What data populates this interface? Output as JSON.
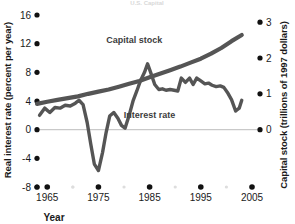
{
  "chart_data": {
    "type": "line",
    "title": "U.S. Capital",
    "xlabel": "Year",
    "ylabel": "Real interest rate (percent per year)",
    "ylabel_right": "Capital stock (trillions of 1997 dollars)",
    "xlim": [
      1963,
      2005
    ],
    "ylim": [
      -8,
      16
    ],
    "ylim_right": [
      -1.6,
      3.2
    ],
    "grid": false,
    "zero_line": true,
    "legend_position": "inline-annotation",
    "x_ticks": [
      1965,
      1975,
      1985,
      1995,
      2005
    ],
    "x_tick_labels": [
      "1965",
      "1975",
      "1985",
      "1995",
      "2005"
    ],
    "y_ticks_left": [
      -8,
      -4,
      0,
      4,
      8,
      12,
      16
    ],
    "y_tick_labels_left": [
      "-8",
      "-4",
      "0",
      "4",
      "8",
      "12",
      "16"
    ],
    "y_ticks_right": [
      0,
      1,
      2,
      3
    ],
    "y_tick_labels_right": [
      "0",
      "1",
      "2",
      "3"
    ],
    "series": [
      {
        "name": "Capital stock",
        "axis": "right",
        "color": "#555555",
        "label_x": 1982,
        "label_y": 2.42,
        "x": [
          1963,
          1965,
          1967,
          1969,
          1971,
          1973,
          1975,
          1977,
          1979,
          1981,
          1983,
          1985,
          1987,
          1989,
          1991,
          1993,
          1995,
          1997,
          1999,
          2001,
          2003
        ],
        "values": [
          0.72,
          0.78,
          0.83,
          0.88,
          0.93,
          1.0,
          1.06,
          1.12,
          1.2,
          1.28,
          1.36,
          1.46,
          1.56,
          1.66,
          1.76,
          1.87,
          1.98,
          2.12,
          2.28,
          2.47,
          2.64
        ]
      },
      {
        "name": "Interest rate",
        "axis": "left",
        "color": "#555555",
        "label_x": 1985,
        "label_y": 1.6,
        "x": [
          1963.5,
          1964.5,
          1965.5,
          1966.5,
          1967.5,
          1968.5,
          1969.5,
          1970.5,
          1971.2,
          1972.0,
          1972.8,
          1973.5,
          1974.2,
          1975.0,
          1975.8,
          1976.5,
          1977.2,
          1978.0,
          1978.8,
          1979.5,
          1980.2,
          1981.0,
          1981.8,
          1982.5,
          1983.2,
          1984.0,
          1984.6,
          1985.2,
          1986.0,
          1986.8,
          1987.5,
          1988.2,
          1989.0,
          1989.8,
          1990.5,
          1991.2,
          1992.0,
          1992.8,
          1993.5,
          1994.2,
          1995.0,
          1995.8,
          1996.5,
          1997.2,
          1998.0,
          1998.8,
          1999.5,
          2000.2,
          2001.0,
          2001.8,
          2002.5,
          2003.0
        ],
        "values": [
          2.0,
          3.0,
          2.4,
          3.1,
          3.0,
          3.4,
          3.3,
          3.7,
          4.1,
          3.5,
          1.0,
          -2.0,
          -4.8,
          -5.7,
          -3.2,
          -0.4,
          1.9,
          2.4,
          1.6,
          0.6,
          0.2,
          2.0,
          4.1,
          5.4,
          6.8,
          8.0,
          9.2,
          8.0,
          6.3,
          5.6,
          5.7,
          5.5,
          5.6,
          5.5,
          5.4,
          7.2,
          6.6,
          7.2,
          6.3,
          7.2,
          6.8,
          6.4,
          6.5,
          6.2,
          6.0,
          6.1,
          5.9,
          5.2,
          4.2,
          2.6,
          3.0,
          4.1
        ]
      }
    ]
  },
  "axes": {
    "left_title": "Real interest rate (percent per year)",
    "right_title": "Capital stock (trillions of 1997 dollars)",
    "x_title": "Year"
  },
  "top_title": "U.S. Capital"
}
